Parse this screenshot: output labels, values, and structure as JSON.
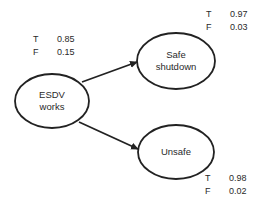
{
  "diagram": {
    "type": "bayesian-network",
    "nodes": [
      {
        "id": "esdv",
        "label_lines": [
          "ESDV",
          "works"
        ],
        "cx": 52,
        "cy": 101,
        "rx": 37,
        "ry": 27,
        "probabilities": [
          {
            "state": "T",
            "value": "0.85"
          },
          {
            "state": "F",
            "value": "0.15"
          }
        ]
      },
      {
        "id": "safe",
        "label_lines": [
          "Safe",
          "shutdown"
        ],
        "cx": 176,
        "cy": 61,
        "rx": 39,
        "ry": 28,
        "probabilities": [
          {
            "state": "T",
            "value": "0.97"
          },
          {
            "state": "F",
            "value": "0.03"
          }
        ]
      },
      {
        "id": "unsafe",
        "label_lines": [
          "Unsafe"
        ],
        "cx": 176,
        "cy": 152,
        "rx": 38,
        "ry": 27,
        "probabilities": [
          {
            "state": "T",
            "value": "0.98"
          },
          {
            "state": "F",
            "value": "0.02"
          }
        ]
      }
    ],
    "edges": [
      {
        "from": "esdv",
        "to": "safe"
      },
      {
        "from": "esdv",
        "to": "unsafe"
      }
    ],
    "colors": {
      "stroke": "#222222",
      "text": "#2a2a2a",
      "background": "#ffffff"
    }
  }
}
